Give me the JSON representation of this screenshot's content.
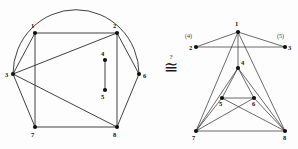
{
  "figure": {
    "caption_symbol": "≅",
    "question_mark": "?",
    "relation_name": "isomorphic-question"
  },
  "left_graph": {
    "name": "left-graph",
    "nodes": [
      {
        "id": "1",
        "label": "1",
        "x": 35,
        "y": 33,
        "lx": 31,
        "ly": 28
      },
      {
        "id": "2",
        "label": "2",
        "x": 117,
        "y": 33,
        "lx": 113,
        "ly": 28
      },
      {
        "id": "3",
        "label": "3",
        "x": 13,
        "y": 74,
        "lx": 5,
        "ly": 77
      },
      {
        "id": "4",
        "label": "4",
        "x": 105,
        "y": 60,
        "lx": 101,
        "ly": 56
      },
      {
        "id": "5",
        "label": "5",
        "x": 105,
        "y": 90,
        "lx": 101,
        "ly": 99
      },
      {
        "id": "6",
        "label": "6",
        "x": 139,
        "y": 74,
        "lx": 143,
        "ly": 78
      },
      {
        "id": "7",
        "label": "7",
        "x": 35,
        "y": 127,
        "lx": 31,
        "ly": 137
      },
      {
        "id": "8",
        "label": "8",
        "x": 117,
        "y": 127,
        "lx": 113,
        "ly": 137
      }
    ],
    "edges": [
      [
        "1",
        "2"
      ],
      [
        "1",
        "3"
      ],
      [
        "1",
        "7"
      ],
      [
        "2",
        "3"
      ],
      [
        "2",
        "6"
      ],
      [
        "2",
        "8"
      ],
      [
        "3",
        "7"
      ],
      [
        "3",
        "8"
      ],
      [
        "4",
        "5"
      ],
      [
        "6",
        "8"
      ],
      [
        "7",
        "8"
      ]
    ],
    "arc": {
      "from": "3",
      "to": "6",
      "note": "semicircular arc over nodes 1 and 2"
    }
  },
  "right_graph": {
    "name": "right-graph",
    "nodes": [
      {
        "id": "1",
        "label": "1",
        "x": 238,
        "y": 32,
        "lx": 235,
        "ly": 26
      },
      {
        "id": "2",
        "label": "2",
        "x": 196,
        "y": 47,
        "lx": 189,
        "ly": 50
      },
      {
        "id": "3",
        "label": "3",
        "x": 285,
        "y": 47,
        "lx": 288,
        "ly": 50
      },
      {
        "id": "4",
        "label": "4",
        "x": 238,
        "y": 68,
        "lx": 241,
        "ly": 65
      },
      {
        "id": "5",
        "label": "5",
        "x": 222,
        "y": 98,
        "lx": 219,
        "ly": 106
      },
      {
        "id": "6",
        "label": "6",
        "x": 254,
        "y": 98,
        "lx": 252,
        "ly": 106
      },
      {
        "id": "7",
        "label": "7",
        "x": 196,
        "y": 131,
        "lx": 192,
        "ly": 140
      },
      {
        "id": "8",
        "label": "8",
        "x": 285,
        "y": 131,
        "lx": 283,
        "ly": 140
      }
    ],
    "edges": [
      [
        "1",
        "2"
      ],
      [
        "1",
        "3"
      ],
      [
        "1",
        "4"
      ],
      [
        "1",
        "7"
      ],
      [
        "1",
        "8"
      ],
      [
        "2",
        "3"
      ],
      [
        "4",
        "5"
      ],
      [
        "4",
        "6"
      ],
      [
        "4",
        "7"
      ],
      [
        "4",
        "8"
      ],
      [
        "5",
        "6"
      ],
      [
        "5",
        "7"
      ],
      [
        "5",
        "8"
      ],
      [
        "6",
        "7"
      ],
      [
        "6",
        "8"
      ],
      [
        "7",
        "8"
      ]
    ],
    "paren_labels": [
      {
        "text": "(4)",
        "x": 185,
        "y": 38,
        "for": "2"
      },
      {
        "text": "(5)",
        "x": 277,
        "y": 38,
        "for": "3"
      }
    ]
  }
}
